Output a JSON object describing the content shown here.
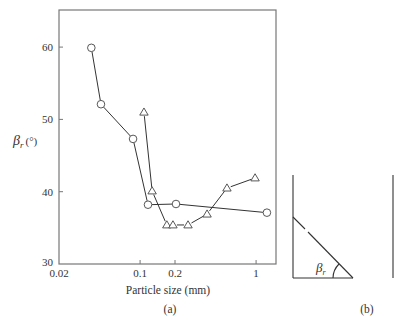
{
  "chart_data": [
    {
      "panel": "(a)",
      "type": "line",
      "title": "",
      "xlabel": "Particle size (mm)",
      "ylabel": "β_r (°)",
      "ylabel_main": "β",
      "ylabel_sub": "r",
      "ylabel_unit": "(°)",
      "xscale": "log",
      "xlim": [
        0.02,
        1.45
      ],
      "ylim": [
        30,
        65
      ],
      "xticks": [
        0.02,
        0.1,
        0.2,
        1
      ],
      "xtick_labels": [
        "0.02",
        "0.1",
        "0.2",
        "1"
      ],
      "yticks": [
        30,
        40,
        50,
        60
      ],
      "ytick_labels": [
        "30",
        "40",
        "50",
        "60"
      ],
      "grid": false,
      "legend": null,
      "series": [
        {
          "name": "circles",
          "marker": "circle",
          "x": [
            0.038,
            0.046,
            0.087,
            0.117,
            0.204,
            1.24
          ],
          "y": [
            59.9,
            52.1,
            47.3,
            38.2,
            38.3,
            37.1
          ]
        },
        {
          "name": "triangles",
          "marker": "triangle",
          "x": [
            0.108,
            0.127,
            0.17,
            0.192,
            0.259,
            0.378,
            0.561,
            0.98
          ],
          "y": [
            51.0,
            40.1,
            35.4,
            35.4,
            35.4,
            36.9,
            40.5,
            41.9
          ]
        }
      ]
    },
    {
      "panel": "(b)",
      "type": "diagram",
      "description": "Angle of repose schematic: container walls with sloped particle surface",
      "angle_label_main": "β",
      "angle_label_sub": "r"
    }
  ],
  "labels": {
    "panel_a": "(a)",
    "panel_b": "(b)"
  }
}
